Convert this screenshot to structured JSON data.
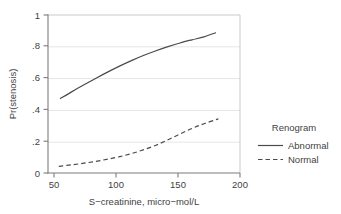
{
  "chart_data": {
    "type": "line",
    "title": "",
    "subtitle": "",
    "xlabel": "S−creatinine, micro−mol/L",
    "ylabel": "Pr(stenosis)",
    "xlim": [
      45,
      205
    ],
    "ylim": [
      0,
      1
    ],
    "xticks": [
      50,
      100,
      150,
      200
    ],
    "xtick_labels": [
      "50",
      "100",
      "150",
      "200"
    ],
    "yticks": [
      0,
      0.2,
      0.4,
      0.6,
      0.8,
      1
    ],
    "ytick_labels": [
      "0",
      ".2",
      ".4",
      ".6",
      ".8",
      "1"
    ],
    "grid": "horizontal",
    "grid_color": "#e3e3e3",
    "legend_position": "right",
    "legend_title": "Renogram",
    "series": [
      {
        "name": "Abnormal",
        "style": "solid",
        "color": "#4a4a4a",
        "x": [
          55,
          65,
          75,
          85,
          95,
          105,
          115,
          125,
          135,
          145,
          155,
          165,
          175,
          185
        ],
        "values": [
          0.47,
          0.515,
          0.558,
          0.6,
          0.64,
          0.678,
          0.713,
          0.745,
          0.774,
          0.8,
          0.823,
          0.843,
          0.862,
          0.888
        ]
      },
      {
        "name": "Normal",
        "style": "dashed",
        "color": "#4a4a4a",
        "x": [
          54,
          65,
          75,
          85,
          95,
          105,
          115,
          125,
          135,
          145,
          155,
          165,
          175,
          187
        ],
        "values": [
          0.042,
          0.052,
          0.062,
          0.074,
          0.088,
          0.104,
          0.124,
          0.148,
          0.176,
          0.21,
          0.247,
          0.282,
          0.312,
          0.343
        ]
      }
    ]
  },
  "axes": {
    "x_axis_label": "S−creatinine, micro−mol/L",
    "y_axis_label": "Pr(stenosis)",
    "x_tick_0": "50",
    "x_tick_1": "100",
    "x_tick_2": "150",
    "x_tick_3": "200",
    "y_tick_0": "0",
    "y_tick_1": ".2",
    "y_tick_2": ".4",
    "y_tick_3": ".6",
    "y_tick_4": ".8",
    "y_tick_5": "1"
  },
  "legend": {
    "title": "Renogram",
    "items": [
      {
        "label": "Abnormal",
        "style": "solid"
      },
      {
        "label": "Normal",
        "style": "dashed"
      }
    ]
  },
  "colors": {
    "line": "#4a4a4a",
    "grid": "#e3e3e3",
    "axis": "#8a8a8a",
    "text": "#3f3f3f",
    "background": "#ffffff"
  }
}
